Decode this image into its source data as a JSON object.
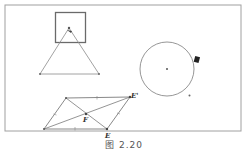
{
  "figure": {
    "caption": "图 2.20",
    "frame": {
      "x": 5,
      "y": 5,
      "width": 236,
      "height": 126,
      "stroke": "#9a9a9a"
    },
    "line_color": "#7a7a7a",
    "square": {
      "x": 55,
      "y": 12,
      "size": 30,
      "stroke": "#6f6f6f"
    },
    "triangle": {
      "apex": [
        69,
        28
      ],
      "base_left": [
        40,
        74
      ],
      "base_right": [
        99,
        74
      ]
    },
    "circle": {
      "center": [
        167,
        69
      ],
      "radius": 27,
      "handle": [
        197,
        59
      ],
      "point": [
        190,
        96
      ]
    },
    "parallelogram": {
      "vertices": [
        [
          44,
          129
        ],
        [
          66,
          98
        ],
        [
          130,
          97
        ],
        [
          107,
          129
        ]
      ],
      "labels": {
        "E": "E",
        "E_prime": "E'",
        "F": "F"
      }
    }
  }
}
